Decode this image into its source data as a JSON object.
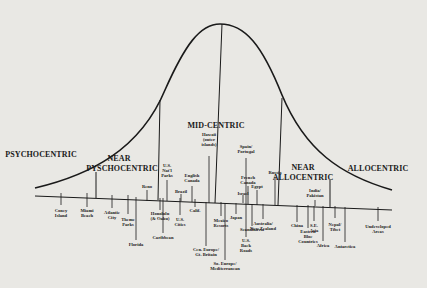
{
  "diagram": {
    "colors": {
      "background": "#e9e8e4",
      "ink": "#1a1a1a"
    },
    "curve": {
      "path": "M35,188 C90,175 140,150 165,90 C185,45 200,24 220,24 C245,24 262,45 282,95 C305,150 340,175 392,190",
      "apex": [
        220,
        24
      ]
    },
    "baseline": {
      "x1": 35,
      "y1": 196,
      "x2": 392,
      "y2": 210
    },
    "divider_lines": [
      {
        "x1": 96,
        "y1": 172,
        "x2": 96,
        "y2": 198
      },
      {
        "x1": 160,
        "y1": 100,
        "x2": 158,
        "y2": 200
      },
      {
        "x1": 222,
        "y1": 24,
        "x2": 215,
        "y2": 203
      },
      {
        "x1": 282,
        "y1": 98,
        "x2": 278,
        "y2": 205
      },
      {
        "x1": 330,
        "y1": 180,
        "x2": 330,
        "y2": 207
      }
    ],
    "segments": [
      {
        "label": "PSYCHOCENTRIC",
        "x": 41,
        "y": 156
      },
      {
        "label": "NEAR",
        "x": 119,
        "y": 160
      },
      {
        "label": "PYSCHOCENTRIC",
        "x": 122,
        "y": 170
      },
      {
        "label": "MID-CENTRIC",
        "x": 216,
        "y": 127
      },
      {
        "label": "NEAR",
        "x": 303,
        "y": 169
      },
      {
        "label": "ALLOCENTRIC",
        "x": 303,
        "y": 179
      },
      {
        "label": "ALLOCENTRIC",
        "x": 378,
        "y": 170
      }
    ],
    "destinations": [
      {
        "label": "Coney\nIsland",
        "x": 61,
        "y": 209,
        "tick_top": 193,
        "tick_bottom": 205
      },
      {
        "label": "Miami\nBeach",
        "x": 87,
        "y": 209,
        "tick_top": 193,
        "tick_bottom": 207
      },
      {
        "label": "Atlantic\nCity",
        "x": 112,
        "y": 211,
        "tick_top": 195,
        "tick_bottom": 208
      },
      {
        "label": "Theme\nParks",
        "x": 128,
        "y": 218,
        "tick_top": 195,
        "tick_bottom": 214
      },
      {
        "label": "Florida",
        "x": 136,
        "y": 243,
        "tick_top": 197,
        "tick_bottom": 240
      },
      {
        "label": "Reno",
        "x": 147,
        "y": 185,
        "tick_top": 190,
        "tick_bottom": 201
      },
      {
        "label": "U.S.\nNat'l\nParks",
        "x": 167,
        "y": 164,
        "tick_top": 180,
        "tick_bottom": 201
      },
      {
        "label": "Honolulu\n(& Oahu)",
        "x": 160,
        "y": 212,
        "tick_top": 198,
        "tick_bottom": 210
      },
      {
        "label": "Caribbean",
        "x": 163,
        "y": 236,
        "tick_top": 198,
        "tick_bottom": 233
      },
      {
        "label": "U.S.\nCities",
        "x": 180,
        "y": 218,
        "tick_top": 198,
        "tick_bottom": 215
      },
      {
        "label": "English\nCanada",
        "x": 192,
        "y": 174,
        "tick_top": 186,
        "tick_bottom": 202
      },
      {
        "label": "Brazil",
        "x": 181,
        "y": 190,
        "tick_top": 194,
        "tick_bottom": 201
      },
      {
        "label": "Calif.",
        "x": 195,
        "y": 209,
        "tick_top": 199,
        "tick_bottom": 207
      },
      {
        "label": "Hawaii\n(outer\nislands)",
        "x": 209,
        "y": 133,
        "tick_top": 156,
        "tick_bottom": 203
      },
      {
        "label": "Cen. Europe/\nGt. Britain",
        "x": 206,
        "y": 248,
        "tick_top": 202,
        "tick_bottom": 246
      },
      {
        "label": "Mexico\nResorts",
        "x": 221,
        "y": 219,
        "tick_top": 202,
        "tick_bottom": 216
      },
      {
        "label": "So. Europe/\nMediterranean",
        "x": 225,
        "y": 262,
        "tick_top": 203,
        "tick_bottom": 260
      },
      {
        "label": "Israel",
        "x": 243,
        "y": 192,
        "tick_top": 195,
        "tick_bottom": 203
      },
      {
        "label": "Spain/\nPortugal",
        "x": 246,
        "y": 145,
        "tick_top": 158,
        "tick_bottom": 204
      },
      {
        "label": "Japan",
        "x": 236,
        "y": 216,
        "tick_top": 203,
        "tick_bottom": 214
      },
      {
        "label": "French\nCanada",
        "x": 248,
        "y": 176,
        "tick_top": 186,
        "tick_bottom": 204
      },
      {
        "label": "Scandinavia",
        "x": 252,
        "y": 228,
        "tick_top": 204,
        "tick_bottom": 226
      },
      {
        "label": "U.S.\nBack\nRoads",
        "x": 246,
        "y": 239,
        "tick_top": 204,
        "tick_bottom": 237
      },
      {
        "label": "Australia/\nNew Zealand",
        "x": 263,
        "y": 222,
        "tick_top": 204,
        "tick_bottom": 219
      },
      {
        "label": "Egypt",
        "x": 257,
        "y": 185,
        "tick_top": 190,
        "tick_bottom": 205
      },
      {
        "label": "Russia",
        "x": 275,
        "y": 171,
        "tick_top": 177,
        "tick_bottom": 205
      },
      {
        "label": "India/\nPakistan",
        "x": 315,
        "y": 189,
        "tick_top": 200,
        "tick_bottom": 206
      },
      {
        "label": "China",
        "x": 297,
        "y": 224,
        "tick_top": 205,
        "tick_bottom": 222
      },
      {
        "label": "Eastern\nBloc\nCountries",
        "x": 308,
        "y": 230,
        "tick_top": 205,
        "tick_bottom": 228
      },
      {
        "label": "S.E.\nAsia",
        "x": 314,
        "y": 224,
        "tick_top": 206,
        "tick_bottom": 221
      },
      {
        "label": "Africa",
        "x": 323,
        "y": 244,
        "tick_top": 206,
        "tick_bottom": 241
      },
      {
        "label": "Nepal/\nTibet",
        "x": 335,
        "y": 223,
        "tick_top": 206,
        "tick_bottom": 218
      },
      {
        "label": "Antarctica",
        "x": 345,
        "y": 245,
        "tick_top": 207,
        "tick_bottom": 242
      },
      {
        "label": "Undeveloped\nAreas",
        "x": 378,
        "y": 225,
        "tick_top": 207,
        "tick_bottom": 221
      }
    ]
  }
}
